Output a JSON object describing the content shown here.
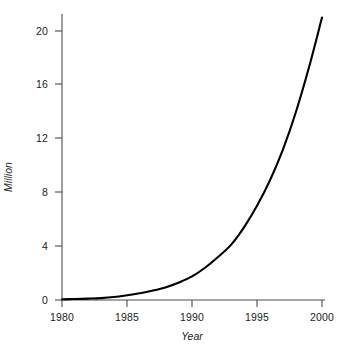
{
  "chart_data": {
    "type": "line",
    "title": "",
    "subtitle": "",
    "xlabel": "Year",
    "ylabel": "Million",
    "xlim": [
      1980,
      2000
    ],
    "ylim": [
      0,
      21.2
    ],
    "grid": false,
    "legend": null,
    "line_color": "#000000",
    "axis_color": "#4d4d4d",
    "background_color": "#ffffff",
    "xticks": [
      1980,
      1985,
      1990,
      1995,
      2000
    ],
    "xtick_labels": [
      "1980",
      "1985",
      "1990",
      "1995",
      "2000"
    ],
    "yticks": [
      0,
      4,
      8,
      12,
      16,
      20
    ],
    "ytick_labels": [
      "0",
      "4",
      "8",
      "12",
      "16",
      "20"
    ],
    "x": [
      1980,
      1981,
      1982,
      1983,
      1984,
      1985,
      1986,
      1987,
      1988,
      1989,
      1990,
      1991,
      1992,
      1993,
      1994,
      1995,
      1996,
      1997,
      1998,
      1999,
      2000
    ],
    "series": [
      {
        "name": "Million",
        "values": [
          0.05,
          0.07,
          0.1,
          0.14,
          0.22,
          0.35,
          0.5,
          0.7,
          0.95,
          1.3,
          1.75,
          2.4,
          3.2,
          4.1,
          5.4,
          7.0,
          8.9,
          11.2,
          14.0,
          17.3,
          21.0
        ]
      }
    ],
    "annotations": []
  },
  "axes": {
    "y_label_text": "Million",
    "x_label_text": "Year"
  }
}
